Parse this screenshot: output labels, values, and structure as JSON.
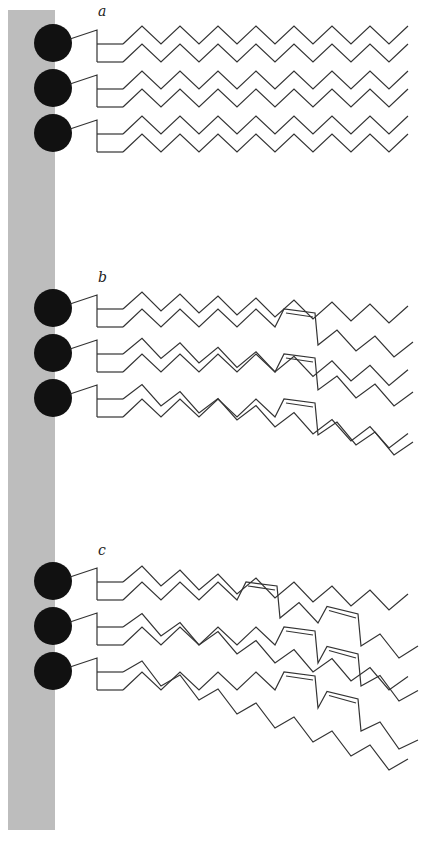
{
  "figure": {
    "substrate": {
      "color": "#bdbdbd",
      "x": 8,
      "y": 10,
      "width": 47,
      "height": 820
    },
    "head_color": "#111111",
    "line_color": "#333333",
    "panels": [
      {
        "label": "a",
        "label_pos": [
          98,
          20
        ],
        "chain_type": "saturated",
        "heads_y": [
          43,
          88,
          133
        ],
        "double_bonds_per_chain": 0
      },
      {
        "label": "b",
        "label_pos": [
          98,
          287
        ],
        "chain_type": "one cis double bond",
        "heads_y": [
          308,
          353,
          398
        ],
        "double_bonds_per_chain": 1
      },
      {
        "label": "c",
        "label_pos": [
          98,
          560
        ],
        "chain_type": "two cis double bonds",
        "heads_y": [
          581,
          626,
          671
        ],
        "double_bonds_per_chain": 2
      }
    ]
  }
}
